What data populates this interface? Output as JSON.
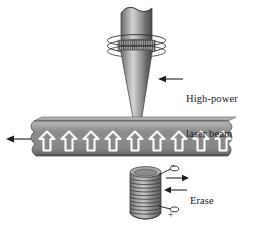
{
  "figure": {
    "type": "technical-diagram",
    "background_color": "#ffffff",
    "width": 261,
    "height": 227
  },
  "labels": {
    "laser_line1": "High-power",
    "laser_line2": "laser beam",
    "erase_line1": "Erase",
    "erase_line2": "current"
  },
  "terminals": {
    "negative": "−",
    "positive": "+"
  },
  "components": {
    "laser_source_name": "laser-emitter-cylinder",
    "laser_band_name": "laser-aperture-band",
    "laser_cone_name": "laser-beam-cone",
    "tape_name": "magnetic-tape-strip",
    "tape_arrow_count": 9,
    "coil_name": "erase-coil-solenoid",
    "coil_winding_count": 12,
    "motion_arrow_name": "tape-motion-arrow"
  },
  "colors": {
    "tape_fill": "#8f8f8f",
    "tape_edge_dark": "#5c5c5c",
    "tape_top_light": "#b5b5b5",
    "arrow_white": "#ffffff",
    "cone_light": "#c9c9c9",
    "cone_mid": "#8a8a8a",
    "cone_dark": "#4e4e4e",
    "coil_fill": "#9a9a9a",
    "text": "#18181f",
    "line": "#1b1b22"
  }
}
